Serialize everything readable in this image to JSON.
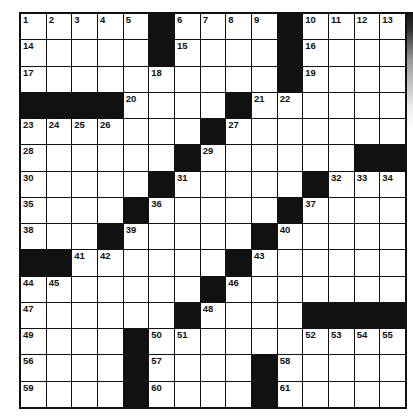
{
  "puzzle": {
    "size": {
      "rows": 15,
      "cols": 15
    },
    "grid": [
      [
        "1",
        "2",
        "3",
        "4",
        "5",
        "#",
        "6",
        "7",
        "8",
        "9",
        "#",
        "10",
        "11",
        "12",
        "13"
      ],
      [
        "14",
        "",
        "",
        "",
        "",
        "#",
        "15",
        "",
        "",
        "",
        "#",
        "16",
        "",
        "",
        ""
      ],
      [
        "17",
        "",
        "",
        "",
        "",
        "18",
        "",
        "",
        "",
        "",
        "#",
        "19",
        "",
        "",
        ""
      ],
      [
        "#",
        "#",
        "#",
        "#",
        "20",
        "",
        "",
        "",
        "#",
        "21",
        "22",
        "",
        "",
        "",
        ""
      ],
      [
        "23",
        "24",
        "25",
        "26",
        "",
        "",
        "",
        "#",
        "27",
        "",
        "",
        "",
        "",
        "",
        ""
      ],
      [
        "28",
        "",
        "",
        "",
        "",
        "",
        "#",
        "29",
        "",
        "",
        "",
        "",
        "",
        "#",
        "#"
      ],
      [
        "30",
        "",
        "",
        "",
        "",
        "#",
        "31",
        "",
        "",
        "",
        "",
        "#",
        "32",
        "33",
        "34"
      ],
      [
        "35",
        "",
        "",
        "",
        "#",
        "36",
        "",
        "",
        "",
        "",
        "#",
        "37",
        "",
        "",
        ""
      ],
      [
        "38",
        "",
        "",
        "#",
        "39",
        "",
        "",
        "",
        "",
        "#",
        "40",
        "",
        "",
        "",
        ""
      ],
      [
        "#",
        "#",
        "41",
        "42",
        "",
        "",
        "",
        "",
        "#",
        "43",
        "",
        "",
        "",
        "",
        ""
      ],
      [
        "44",
        "45",
        "",
        "",
        "",
        "",
        "",
        "#",
        "46",
        "",
        "",
        "",
        "",
        "",
        ""
      ],
      [
        "47",
        "",
        "",
        "",
        "",
        "",
        "#",
        "48",
        "",
        "",
        "",
        "#",
        "#",
        "#",
        "#"
      ],
      [
        "49",
        "",
        "",
        "",
        "#",
        "50",
        "51",
        "",
        "",
        "",
        "",
        "52",
        "53",
        "54",
        "55"
      ],
      [
        "56",
        "",
        "",
        "",
        "#",
        "57",
        "",
        "",
        "",
        "#",
        "58",
        "",
        "",
        "",
        ""
      ],
      [
        "59",
        "",
        "",
        "",
        "#",
        "60",
        "",
        "",
        "",
        "#",
        "61",
        "",
        "",
        "",
        ""
      ]
    ],
    "colors": {
      "block": "#111111",
      "cell": "#ffffff",
      "line": "#111111"
    }
  }
}
